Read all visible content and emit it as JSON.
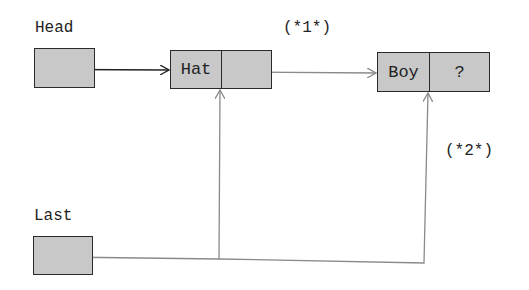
{
  "diagram": {
    "type": "linked-list",
    "pointers": [
      {
        "name": "Head",
        "label": "Head",
        "points_to": "Hat"
      },
      {
        "name": "Last",
        "label": "Last",
        "points_to": [
          "Hat.link",
          "Boy.link"
        ]
      }
    ],
    "nodes": [
      {
        "id": "Hat",
        "value": "Hat",
        "next": "Boy"
      },
      {
        "id": "Boy",
        "value": "Boy",
        "next": "?"
      }
    ],
    "annotations": [
      {
        "id": "step1",
        "text": "(*1*)"
      },
      {
        "id": "step2",
        "text": "(*2*)"
      }
    ],
    "colors": {
      "box_fill": "#c8c8c8",
      "box_border": "#2a2a2a",
      "primary_arrow": "#222222",
      "secondary_arrow": "#8a8a8a"
    }
  }
}
